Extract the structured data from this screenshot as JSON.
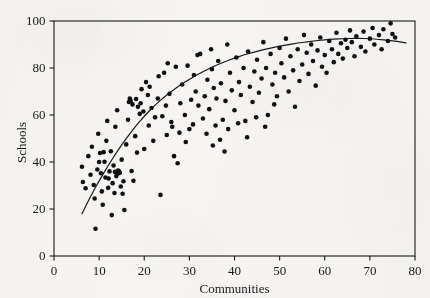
{
  "figure": {
    "background_color": "#f6f5f3",
    "ink_color": "#1a1a1a",
    "width": 430,
    "height": 298
  },
  "chart_data": {
    "type": "scatter",
    "title": "",
    "xlabel": "Communities",
    "ylabel": "Schools",
    "xlim": [
      0,
      80
    ],
    "ylim": [
      0,
      100
    ],
    "xticks": [
      0,
      10,
      20,
      30,
      40,
      50,
      60,
      70,
      80
    ],
    "yticks": [
      0,
      20,
      40,
      60,
      80,
      100
    ],
    "xtick_labels": [
      "0",
      "10",
      "20",
      "30",
      "40",
      "50",
      "60",
      "70",
      "80"
    ],
    "ytick_labels": [
      "0",
      "20",
      "40",
      "60",
      "80",
      "100"
    ],
    "grid": false,
    "legend": null,
    "frame": "box",
    "marker": {
      "shape": "circle",
      "color": "#111111",
      "size": 4.6
    },
    "points": [
      [
        6.2,
        38.0
      ],
      [
        6.4,
        31.5
      ],
      [
        7.0,
        28.8
      ],
      [
        7.6,
        42.5
      ],
      [
        8.1,
        34.6
      ],
      [
        8.4,
        46.5
      ],
      [
        8.8,
        30.2
      ],
      [
        9.0,
        24.5
      ],
      [
        9.2,
        11.6
      ],
      [
        9.6,
        36.8
      ],
      [
        9.8,
        52.0
      ],
      [
        10.2,
        43.8
      ],
      [
        10.4,
        35.2
      ],
      [
        10.6,
        27.5
      ],
      [
        10.8,
        21.8
      ],
      [
        11.2,
        40.1
      ],
      [
        11.4,
        33.4
      ],
      [
        11.6,
        49.0
      ],
      [
        11.8,
        57.5
      ],
      [
        12.0,
        29.0
      ],
      [
        12.3,
        36.0
      ],
      [
        12.6,
        44.6
      ],
      [
        12.8,
        17.4
      ],
      [
        13.0,
        31.0
      ],
      [
        13.2,
        38.5
      ],
      [
        13.4,
        26.8
      ],
      [
        13.6,
        55.0
      ],
      [
        13.8,
        34.0
      ],
      [
        14.0,
        62.0
      ],
      [
        14.2,
        36.4
      ],
      [
        14.4,
        36.0
      ],
      [
        14.6,
        35.4
      ],
      [
        14.8,
        29.6
      ],
      [
        15.0,
        41.0
      ],
      [
        15.2,
        26.5
      ],
      [
        15.4,
        31.8
      ],
      [
        15.6,
        19.6
      ],
      [
        16.0,
        47.5
      ],
      [
        16.4,
        58.0
      ],
      [
        16.6,
        65.5
      ],
      [
        17.2,
        36.2
      ],
      [
        17.6,
        32.0
      ],
      [
        18.0,
        51.0
      ],
      [
        18.4,
        44.0
      ],
      [
        19.0,
        60.5
      ],
      [
        19.4,
        71.0
      ],
      [
        20.0,
        45.5
      ],
      [
        20.4,
        74.0
      ],
      [
        21.0,
        55.5
      ],
      [
        21.6,
        63.0
      ],
      [
        22.0,
        49.0
      ],
      [
        23.0,
        67.0
      ],
      [
        23.6,
        26.0
      ],
      [
        24.0,
        59.5
      ],
      [
        24.4,
        78.0
      ],
      [
        25.0,
        51.5
      ],
      [
        25.6,
        69.0
      ],
      [
        26.0,
        57.0
      ],
      [
        26.6,
        42.5
      ],
      [
        27.0,
        80.5
      ],
      [
        27.4,
        39.5
      ],
      [
        28.0,
        65.0
      ],
      [
        28.4,
        73.0
      ],
      [
        29.0,
        60.0
      ],
      [
        29.6,
        81.0
      ],
      [
        30.0,
        54.0
      ],
      [
        30.4,
        66.5
      ],
      [
        31.0,
        77.0
      ],
      [
        31.4,
        70.0
      ],
      [
        32.0,
        64.0
      ],
      [
        32.4,
        86.0
      ],
      [
        33.0,
        58.5
      ],
      [
        33.4,
        68.0
      ],
      [
        34.0,
        75.0
      ],
      [
        34.4,
        62.5
      ],
      [
        35.0,
        79.5
      ],
      [
        35.4,
        71.5
      ],
      [
        36.0,
        67.0
      ],
      [
        36.4,
        83.0
      ],
      [
        37.0,
        73.5
      ],
      [
        37.4,
        58.0
      ],
      [
        38.0,
        66.0
      ],
      [
        38.4,
        90.0
      ],
      [
        39.0,
        78.0
      ],
      [
        39.4,
        70.5
      ],
      [
        40.0,
        62.0
      ],
      [
        40.4,
        84.5
      ],
      [
        41.0,
        74.0
      ],
      [
        41.4,
        68.5
      ],
      [
        42.0,
        80.0
      ],
      [
        42.4,
        57.5
      ],
      [
        43.0,
        87.0
      ],
      [
        43.4,
        72.0
      ],
      [
        44.0,
        65.5
      ],
      [
        44.4,
        78.5
      ],
      [
        45.0,
        83.5
      ],
      [
        45.4,
        69.5
      ],
      [
        46.0,
        75.5
      ],
      [
        46.4,
        91.0
      ],
      [
        47.0,
        80.0
      ],
      [
        47.4,
        60.0
      ],
      [
        48.0,
        86.0
      ],
      [
        48.4,
        73.0
      ],
      [
        49.0,
        78.0
      ],
      [
        49.4,
        68.0
      ],
      [
        50.0,
        88.5
      ],
      [
        50.4,
        82.0
      ],
      [
        51.0,
        76.0
      ],
      [
        51.4,
        92.5
      ],
      [
        52.0,
        70.0
      ],
      [
        52.4,
        85.0
      ],
      [
        53.0,
        79.0
      ],
      [
        53.4,
        63.5
      ],
      [
        54.0,
        88.0
      ],
      [
        54.4,
        74.5
      ],
      [
        55.0,
        81.5
      ],
      [
        55.4,
        94.0
      ],
      [
        56.0,
        86.5
      ],
      [
        56.4,
        77.5
      ],
      [
        57.0,
        90.0
      ],
      [
        57.4,
        83.0
      ],
      [
        58.0,
        72.5
      ],
      [
        58.4,
        87.5
      ],
      [
        59.0,
        93.0
      ],
      [
        59.4,
        80.5
      ],
      [
        60.0,
        85.5
      ],
      [
        60.4,
        78.0
      ],
      [
        61.0,
        91.5
      ],
      [
        61.6,
        88.0
      ],
      [
        62.0,
        82.5
      ],
      [
        62.6,
        95.0
      ],
      [
        63.0,
        86.0
      ],
      [
        63.6,
        90.5
      ],
      [
        64.0,
        84.0
      ],
      [
        64.6,
        92.0
      ],
      [
        65.0,
        88.5
      ],
      [
        65.6,
        96.0
      ],
      [
        66.0,
        91.0
      ],
      [
        66.6,
        85.0
      ],
      [
        67.0,
        93.5
      ],
      [
        68.0,
        89.0
      ],
      [
        68.6,
        95.5
      ],
      [
        69.0,
        87.0
      ],
      [
        70.0,
        92.5
      ],
      [
        70.6,
        97.0
      ],
      [
        71.0,
        90.0
      ],
      [
        72.0,
        94.0
      ],
      [
        72.6,
        88.0
      ],
      [
        73.0,
        96.5
      ],
      [
        74.0,
        91.5
      ],
      [
        74.6,
        99.0
      ],
      [
        75.0,
        94.5
      ],
      [
        75.6,
        93.0
      ],
      [
        16.8,
        67.0
      ],
      [
        17.0,
        66.0
      ],
      [
        17.4,
        64.5
      ],
      [
        18.2,
        66.8
      ],
      [
        18.6,
        63.5
      ],
      [
        19.2,
        65.0
      ],
      [
        19.8,
        61.5
      ],
      [
        20.8,
        68.5
      ],
      [
        22.4,
        59.0
      ],
      [
        24.8,
        64.0
      ],
      [
        26.2,
        55.0
      ],
      [
        27.8,
        52.5
      ],
      [
        29.2,
        48.5
      ],
      [
        30.8,
        56.0
      ],
      [
        33.8,
        52.0
      ],
      [
        35.8,
        55.5
      ],
      [
        36.8,
        49.5
      ],
      [
        38.6,
        54.0
      ],
      [
        35.2,
        47.0
      ],
      [
        37.8,
        44.5
      ],
      [
        40.8,
        56.5
      ],
      [
        42.8,
        50.5
      ],
      [
        44.8,
        59.0
      ],
      [
        46.8,
        55.0
      ],
      [
        48.8,
        64.5
      ],
      [
        13.5,
        35.8
      ],
      [
        14.1,
        35.0
      ],
      [
        12.1,
        33.0
      ],
      [
        11.0,
        44.2
      ],
      [
        10.0,
        40.0
      ],
      [
        21.2,
        72.0
      ],
      [
        23.2,
        76.5
      ],
      [
        25.2,
        82.0
      ],
      [
        31.8,
        85.5
      ],
      [
        34.8,
        88.0
      ]
    ],
    "fit_curve": {
      "type": "lowess",
      "color": "#1a1a1a",
      "points": [
        [
          6.2,
          18.0
        ],
        [
          8.0,
          25.0
        ],
        [
          10.0,
          32.0
        ],
        [
          12.0,
          38.5
        ],
        [
          14.0,
          44.5
        ],
        [
          16.0,
          50.0
        ],
        [
          18.0,
          55.0
        ],
        [
          20.0,
          59.5
        ],
        [
          22.0,
          63.5
        ],
        [
          24.0,
          67.0
        ],
        [
          26.0,
          70.0
        ],
        [
          28.0,
          72.8
        ],
        [
          30.0,
          75.2
        ],
        [
          32.0,
          77.4
        ],
        [
          34.0,
          79.4
        ],
        [
          36.0,
          81.2
        ],
        [
          38.0,
          82.8
        ],
        [
          40.0,
          84.2
        ],
        [
          42.0,
          85.5
        ],
        [
          44.0,
          86.6
        ],
        [
          46.0,
          87.6
        ],
        [
          48.0,
          88.5
        ],
        [
          50.0,
          89.3
        ],
        [
          52.0,
          90.0
        ],
        [
          54.0,
          90.6
        ],
        [
          56.0,
          91.1
        ],
        [
          58.0,
          91.6
        ],
        [
          60.0,
          92.0
        ],
        [
          62.0,
          92.3
        ],
        [
          64.0,
          92.5
        ],
        [
          66.0,
          92.6
        ],
        [
          68.0,
          92.6
        ],
        [
          70.0,
          92.5
        ],
        [
          72.0,
          92.2
        ],
        [
          74.0,
          91.8
        ],
        [
          76.0,
          91.3
        ],
        [
          78.0,
          90.7
        ]
      ]
    }
  }
}
